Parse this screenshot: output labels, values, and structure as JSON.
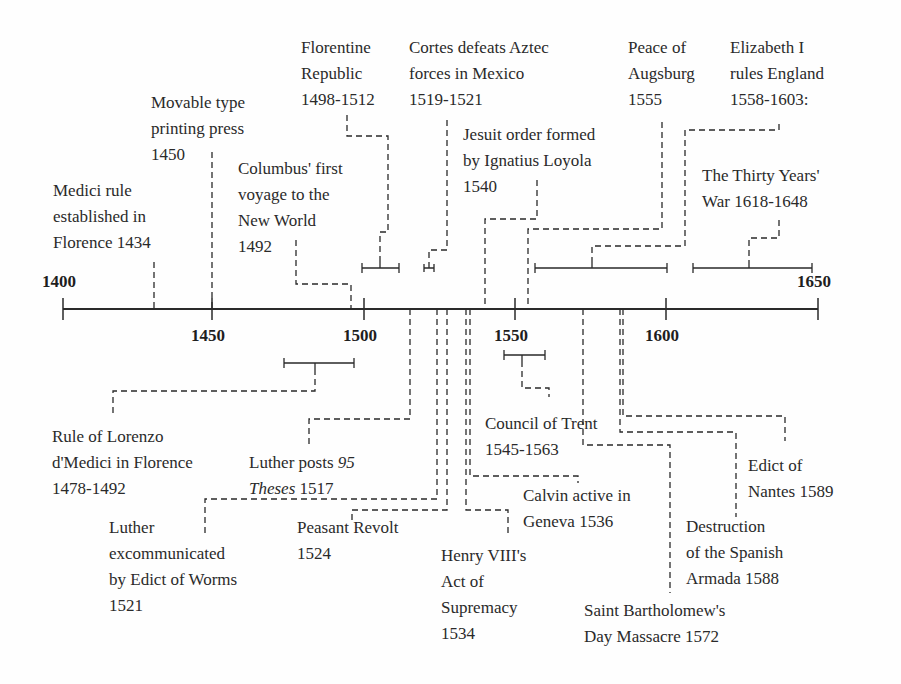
{
  "diagram": {
    "type": "timeline",
    "axis": {
      "start": 1400,
      "end": 1650,
      "ticks": [
        "1400",
        "1450",
        "1500",
        "1550",
        "1600",
        "1650"
      ]
    },
    "events_above": [
      {
        "id": "medici",
        "lines": [
          "Medici rule",
          "established in",
          "Florence 1434"
        ],
        "year": 1434
      },
      {
        "id": "printing",
        "lines": [
          "Movable type",
          "printing press",
          "1450"
        ],
        "year": 1450
      },
      {
        "id": "columbus",
        "lines": [
          "Columbus' first",
          "voyage to the",
          "New World",
          "1492"
        ],
        "year": 1492
      },
      {
        "id": "florentine",
        "lines": [
          "Florentine",
          "Republic",
          "1498-1512"
        ],
        "start": 1498,
        "end": 1512
      },
      {
        "id": "cortes",
        "lines": [
          "Cortes defeats Aztec",
          "forces in Mexico",
          "1519-1521"
        ],
        "start": 1519,
        "end": 1521
      },
      {
        "id": "jesuit",
        "lines": [
          "Jesuit order formed",
          "by Ignatius Loyola",
          "1540"
        ],
        "year": 1540
      },
      {
        "id": "augsburg",
        "lines": [
          "Peace of",
          "Augsburg",
          "1555"
        ],
        "year": 1555
      },
      {
        "id": "elizabeth",
        "lines": [
          "Elizabeth I",
          "rules England",
          "1558-1603:"
        ],
        "start": 1558,
        "end": 1603
      },
      {
        "id": "thirty",
        "lines": [
          "The Thirty Years'",
          "War 1618-1648"
        ],
        "start": 1618,
        "end": 1648
      }
    ],
    "events_below": [
      {
        "id": "lorenzo",
        "lines": [
          "Rule of Lorenzo",
          "d'Medici in Florence",
          "1478-1492"
        ],
        "start": 1478,
        "end": 1492
      },
      {
        "id": "luther95",
        "line1_a": "Luther posts ",
        "line1_b": "95",
        "line2_a": "Theses",
        "line2_b": " 1517",
        "year": 1517
      },
      {
        "id": "worms",
        "lines": [
          "Luther",
          "excommunicated",
          "by Edict of Worms",
          "1521"
        ],
        "year": 1521
      },
      {
        "id": "peasant",
        "lines": [
          "Peasant Revolt",
          "1524"
        ],
        "year": 1524
      },
      {
        "id": "henry",
        "lines": [
          "Henry VIII's",
          "Act of",
          "Supremacy",
          "1534"
        ],
        "year": 1534
      },
      {
        "id": "calvin",
        "lines": [
          "Calvin active in",
          "Geneva 1536"
        ],
        "year": 1536
      },
      {
        "id": "trent",
        "lines": [
          "Council of Trent",
          "1545-1563"
        ],
        "start": 1545,
        "end": 1563
      },
      {
        "id": "bartholomew",
        "lines": [
          "Saint Bartholomew's",
          "Day Massacre 1572"
        ],
        "year": 1572
      },
      {
        "id": "armada",
        "lines": [
          "Destruction",
          "of the Spanish",
          "Armada 1588"
        ],
        "year": 1588
      },
      {
        "id": "nantes",
        "lines": [
          "Edict of",
          "Nantes 1589"
        ],
        "year": 1589
      }
    ]
  }
}
